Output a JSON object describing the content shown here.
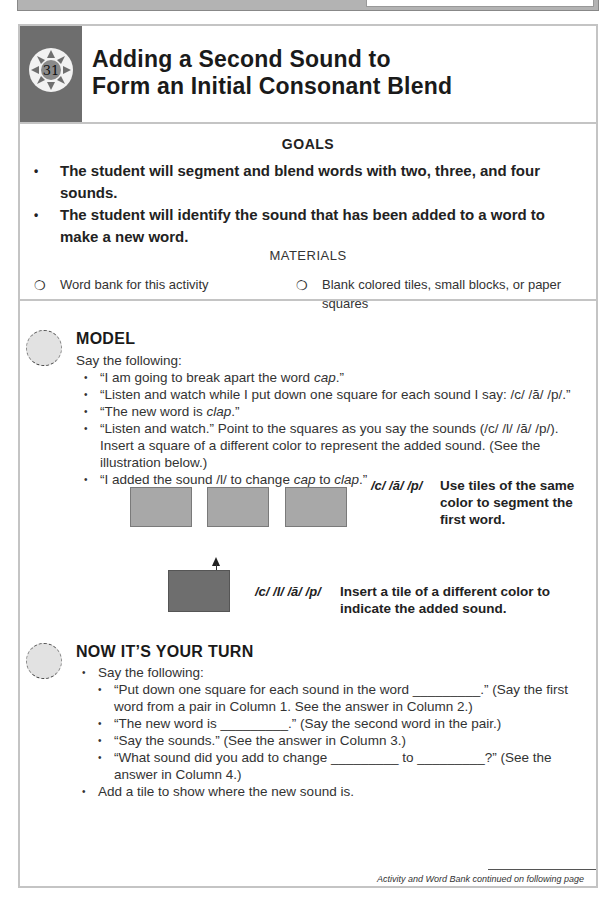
{
  "page": {
    "activity_number": "31",
    "title_line1": "Adding a Second Sound to",
    "title_line2": "Form an Initial Consonant Blend"
  },
  "goals": {
    "heading": "GOALS",
    "items": [
      "The student will segment and blend words with two, three, and four sounds.",
      "The student will identify the sound that has been added to a word to make a new word."
    ]
  },
  "materials": {
    "heading": "MATERIALS",
    "items": [
      {
        "icon": "circle-checkbox-icon",
        "glyph": "❍",
        "label": "Word bank for this activity"
      },
      {
        "icon": "circle-checkbox-icon",
        "glyph": "❍",
        "label": "Blank colored tiles, small blocks, or paper squares"
      }
    ]
  },
  "model": {
    "heading": "MODEL",
    "intro": "Say the following:",
    "items": [
      {
        "pre": "“I am going to break apart the word ",
        "em": "cap",
        "post": ".”"
      },
      {
        "pre": "“Listen and watch while I put down one square for each sound I say: /c/ /ă/ /p/.”",
        "em": "",
        "post": ""
      },
      {
        "pre": "“The new word is ",
        "em": "clap",
        "post": ".”"
      },
      {
        "pre": "“Listen and watch.” Point to the squares as you say the sounds (/c/ /l/ /ă/ /p/). Insert a square of a different color to represent the added sound. (See the illustration below.)",
        "em": "",
        "post": ""
      },
      {
        "pre": "“I added the sound /l/ to change ",
        "em": "cap",
        "mid": " to ",
        "em2": "clap",
        "post": ".”"
      }
    ],
    "illustration": {
      "top_row_sounds": "/c/ /ă/ /p/",
      "top_row_caption": "Use tiles of the same color to segment the first word.",
      "bottom_sounds": "/c/ /l/ /ă/ /p/",
      "bottom_caption": "Insert a tile of a different color to indicate the added sound.",
      "tile_color": "#a8a8a8",
      "added_tile_color": "#6e6e6e"
    }
  },
  "your_turn": {
    "heading": "NOW IT’S YOUR TURN",
    "items": [
      {
        "text": "Say the following:",
        "subitems": [
          "“Put down one square for each sound in the word _________.” (Say the first word from a pair in Column 1. See the answer in Column 2.)",
          "“The new word is _________.” (Say the second word in the pair.)",
          "“Say the sounds.” (See the answer in Column 3.)",
          "“What sound did you add to change _________ to _________?” (See the answer in Column 4.)"
        ]
      },
      {
        "text": "Add a tile to show where the new sound is.",
        "subitems": []
      }
    ]
  },
  "footer": {
    "continued": "Activity and Word Bank continued on following page"
  }
}
